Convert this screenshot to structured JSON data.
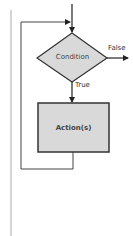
{
  "diagram": {
    "type": "flowchart",
    "title": "",
    "nodes": {
      "condition": {
        "shape": "diamond",
        "label": "Condition"
      },
      "action": {
        "shape": "rectangle",
        "label": "Action(s)"
      }
    },
    "edges": {
      "false_label": "False",
      "true_label": "True"
    },
    "colors": {
      "shape_fill": "#d9d9d9",
      "stroke": "#333333",
      "page_border": "#aaaaaa",
      "background": "#ffffff"
    }
  }
}
